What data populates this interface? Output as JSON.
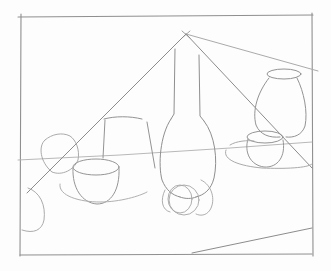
{
  "image": {
    "subject": "Pencil still-life construction sketch",
    "description": "Line drawing of vessels on a table with perspective guide lines",
    "colors": {
      "paper": "#fdfdfd",
      "frame": "#8a8a8a",
      "stroke": "#9a9a9a",
      "light_stroke": "#b5b5b5"
    },
    "objects": [
      "frame",
      "vanishing-point",
      "perspective-lines",
      "horizon-line",
      "bottle",
      "vase",
      "bowl",
      "cylinder-cup",
      "small-pot",
      "spheres",
      "table-edge"
    ]
  }
}
